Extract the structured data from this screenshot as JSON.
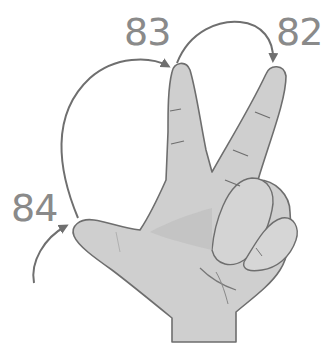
{
  "diagram": {
    "labels": [
      {
        "id": "thumb",
        "value": "84"
      },
      {
        "id": "index",
        "value": "83"
      },
      {
        "id": "middle",
        "value": "82"
      }
    ],
    "arrows": [
      {
        "from": "start",
        "to": "84"
      },
      {
        "from": "84",
        "to": "83"
      },
      {
        "from": "83",
        "to": "82"
      }
    ],
    "colors": {
      "hand_fill": "#cfcfcf",
      "hand_outline": "#6e6e6e",
      "arrow": "#6f6f6f",
      "label": "#8a8a8a",
      "background": "#ffffff"
    }
  }
}
